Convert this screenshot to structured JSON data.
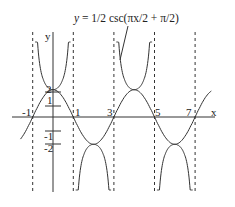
{
  "chart_data": {
    "type": "line",
    "title": "y = 1/2 csc(πx/2 + π/2)",
    "xlabel": "x",
    "ylabel": "y",
    "x_tick_labels": [
      "-1",
      "1",
      "3",
      "5",
      "7"
    ],
    "y_tick_labels": [
      "2",
      "1",
      "-1",
      "-2"
    ],
    "xlim": [
      -1.5,
      9
    ],
    "ylim": [
      -4,
      4.5
    ],
    "grid": false,
    "asymptotes_x": [
      -1,
      1,
      3,
      5,
      7
    ],
    "series": [
      {
        "name": "y = 1/2 csc(πx/2 + π/2)",
        "style": "solid",
        "kind": "cosecant branches"
      },
      {
        "name": "y = 1/2 cos(πx/2)",
        "style": "solid",
        "kind": "guide sine-wave",
        "x": [
          -1.5,
          -1,
          0,
          1,
          2,
          3,
          4,
          5,
          6,
          7,
          8
        ],
        "values": [
          -0.354,
          0,
          0.5,
          0,
          -0.5,
          0,
          0.5,
          0,
          -0.5,
          0,
          0.5
        ]
      }
    ],
    "annotations": [
      {
        "text": "y = 1/2 csc(πx/2 + π/2)",
        "points_to": "branch near x=3"
      }
    ]
  },
  "labels": {
    "title_y": "y",
    "title_rest": " = 1/2 csc(πx/2 + π/2)",
    "y_axis": "y",
    "x_axis": "x",
    "ticks_x": [
      "-1",
      "1",
      "3",
      "5",
      "7"
    ],
    "ticks_y": [
      "2",
      "1",
      "-1",
      "-2"
    ]
  }
}
